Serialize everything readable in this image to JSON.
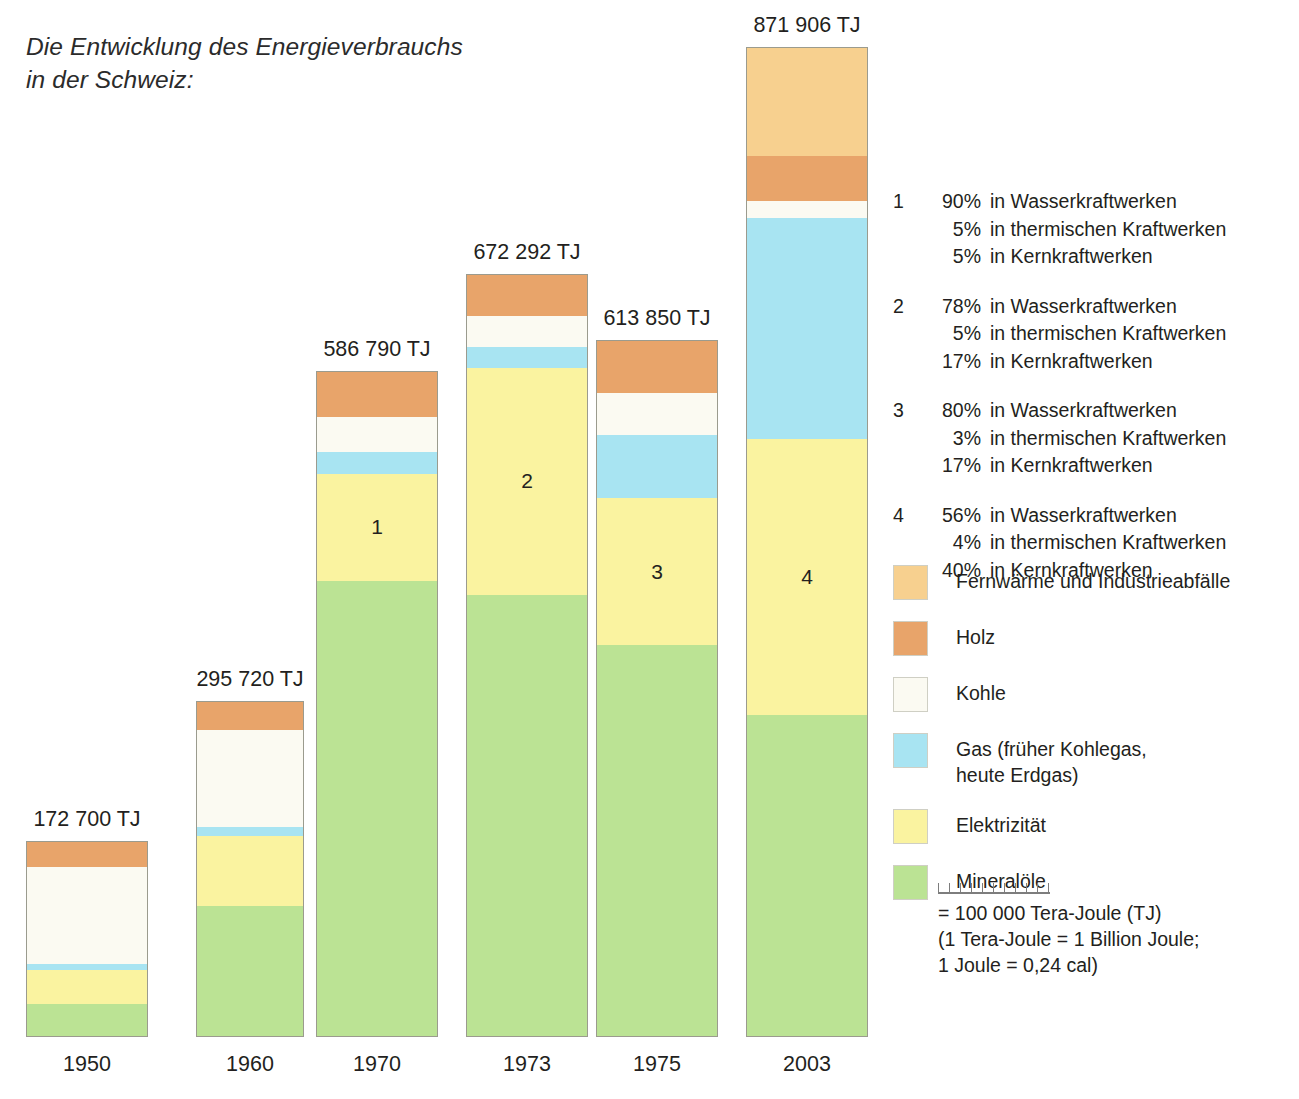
{
  "title": {
    "line1": "Die Entwicklung des Energieverbrauchs",
    "line2": "in der Schweiz:"
  },
  "chart_data": {
    "type": "bar",
    "subtype": "stacked-bar",
    "title": "Die Entwicklung des Energieverbrauchs in der Schweiz:",
    "xlabel": "",
    "ylabel": "Tera-Joule (TJ)",
    "unit": "TJ",
    "grid": false,
    "legend_position": "right",
    "scale_note": "= 100 000 Tera-Joule (TJ)",
    "categories": [
      "1950",
      "1960",
      "1970",
      "1973",
      "1975",
      "2003"
    ],
    "totals": [
      172700,
      295720,
      586790,
      672292,
      613850,
      871906
    ],
    "total_labels": [
      "172 700 TJ",
      "295 720 TJ",
      "586 790 TJ",
      "672 292 TJ",
      "613 850 TJ",
      "871 906 TJ"
    ],
    "series": [
      {
        "name": "Mineralöle",
        "key": "mineraloele",
        "color": "#BBE394",
        "values": [
          25000,
          115000,
          360000,
          390000,
          345000,
          345000
        ]
      },
      {
        "name": "Elektrizität",
        "key": "elektrizitaet",
        "color": "#FAF3A0",
        "values": [
          30000,
          62000,
          95000,
          200000,
          130000,
          243000
        ]
      },
      {
        "name": "Gas (früher Kohlegas, heute Erdgas)",
        "key": "gas",
        "color": "#A8E4F2",
        "values": [
          6000,
          8000,
          19000,
          19000,
          56000,
          195000
        ]
      },
      {
        "name": "Kohle",
        "key": "kohle",
        "color": "#FBFAF2",
        "values": [
          90000,
          86000,
          73000,
          27000,
          37000,
          15000
        ]
      },
      {
        "name": "Holz",
        "key": "holz",
        "color": "#E8A46A",
        "values": [
          22000,
          25000,
          40000,
          36000,
          46000,
          40000
        ]
      },
      {
        "name": "Fernwärme und Industrieabfälle",
        "key": "fernwaerme",
        "color": "#F7D08F",
        "values": [
          0,
          0,
          0,
          0,
          0,
          95000
        ]
      }
    ],
    "segment_annotations": [
      {
        "category": "1970",
        "series": "Elektrizität",
        "label": "1"
      },
      {
        "category": "1973",
        "series": "Elektrizität",
        "label": "2"
      },
      {
        "category": "1975",
        "series": "Elektrizität",
        "label": "3"
      },
      {
        "category": "2003",
        "series": "Elektrizität",
        "label": "4"
      }
    ]
  },
  "bars": [
    {
      "year": "1950",
      "total_label": "172 700 TJ",
      "segments": [
        {
          "key": "fernwaerme",
          "pct": 0,
          "num": ""
        },
        {
          "key": "holz",
          "pct": 12.7,
          "num": ""
        },
        {
          "key": "kohle",
          "pct": 50.0,
          "num": ""
        },
        {
          "key": "gas",
          "pct": 3.5,
          "num": ""
        },
        {
          "key": "elektrizitaet",
          "pct": 17.4,
          "num": ""
        },
        {
          "key": "mineraloele",
          "pct": 16.4,
          "num": ""
        }
      ]
    },
    {
      "year": "1960",
      "total_label": "295 720 TJ",
      "segments": [
        {
          "key": "fernwaerme",
          "pct": 0,
          "num": ""
        },
        {
          "key": "holz",
          "pct": 8.4,
          "num": ""
        },
        {
          "key": "kohle",
          "pct": 29.1,
          "num": ""
        },
        {
          "key": "gas",
          "pct": 2.7,
          "num": ""
        },
        {
          "key": "elektrizitaet",
          "pct": 20.9,
          "num": ""
        },
        {
          "key": "mineraloele",
          "pct": 38.9,
          "num": ""
        }
      ]
    },
    {
      "year": "1970",
      "total_label": "586 790 TJ",
      "segments": [
        {
          "key": "fernwaerme",
          "pct": 0,
          "num": ""
        },
        {
          "key": "holz",
          "pct": 6.8,
          "num": ""
        },
        {
          "key": "kohle",
          "pct": 5.3,
          "num": ""
        },
        {
          "key": "gas",
          "pct": 3.2,
          "num": ""
        },
        {
          "key": "elektrizitaet",
          "pct": 16.2,
          "num": "1"
        },
        {
          "key": "mineraloele",
          "pct": 68.5,
          "num": ""
        }
      ]
    },
    {
      "year": "1973",
      "total_label": "672 292 TJ",
      "segments": [
        {
          "key": "fernwaerme",
          "pct": 0,
          "num": ""
        },
        {
          "key": "holz",
          "pct": 5.4,
          "num": ""
        },
        {
          "key": "kohle",
          "pct": 4.0,
          "num": ""
        },
        {
          "key": "gas",
          "pct": 2.8,
          "num": ""
        },
        {
          "key": "elektrizitaet",
          "pct": 29.8,
          "num": "2"
        },
        {
          "key": "mineraloele",
          "pct": 58.0,
          "num": ""
        }
      ]
    },
    {
      "year": "1975",
      "total_label": "613 850 TJ",
      "segments": [
        {
          "key": "fernwaerme",
          "pct": 0,
          "num": ""
        },
        {
          "key": "holz",
          "pct": 7.5,
          "num": ""
        },
        {
          "key": "kohle",
          "pct": 6.0,
          "num": ""
        },
        {
          "key": "gas",
          "pct": 9.1,
          "num": ""
        },
        {
          "key": "elektrizitaet",
          "pct": 21.2,
          "num": "3"
        },
        {
          "key": "mineraloele",
          "pct": 56.2,
          "num": ""
        }
      ]
    },
    {
      "year": "2003",
      "total_label": "871 906 TJ",
      "segments": [
        {
          "key": "fernwaerme",
          "pct": 10.9,
          "num": ""
        },
        {
          "key": "holz",
          "pct": 4.6,
          "num": ""
        },
        {
          "key": "kohle",
          "pct": 1.7,
          "num": ""
        },
        {
          "key": "gas",
          "pct": 22.4,
          "num": ""
        },
        {
          "key": "elektrizitaet",
          "pct": 27.9,
          "num": "4"
        },
        {
          "key": "mineraloele",
          "pct": 32.5,
          "num": ""
        }
      ]
    }
  ],
  "notes": [
    {
      "index": "1",
      "lines": [
        {
          "pct": "90%",
          "text": "in Wasserkraftwerken"
        },
        {
          "pct": "5%",
          "text": "in thermischen Kraftwerken"
        },
        {
          "pct": "5%",
          "text": "in Kernkraftwerken"
        }
      ]
    },
    {
      "index": "2",
      "lines": [
        {
          "pct": "78%",
          "text": "in Wasserkraftwerken"
        },
        {
          "pct": "5%",
          "text": "in thermischen Kraftwerken"
        },
        {
          "pct": "17%",
          "text": "in Kernkraftwerken"
        }
      ]
    },
    {
      "index": "3",
      "lines": [
        {
          "pct": "80%",
          "text": "in Wasserkraftwerken"
        },
        {
          "pct": "3%",
          "text": "in thermischen Kraftwerken"
        },
        {
          "pct": "17%",
          "text": "in Kernkraftwerken"
        }
      ]
    },
    {
      "index": "4",
      "lines": [
        {
          "pct": "56%",
          "text": "in Wasserkraftwerken"
        },
        {
          "pct": "4%",
          "text": "in thermischen Kraftwerken"
        },
        {
          "pct": "40%",
          "text": "in Kernkraftwerken"
        }
      ]
    }
  ],
  "legend": [
    {
      "key": "fernwaerme",
      "color": "#F7D08F",
      "line1": "Fernwärme und Industrieabfälle",
      "line2": ""
    },
    {
      "key": "holz",
      "color": "#E8A46A",
      "line1": "Holz",
      "line2": ""
    },
    {
      "key": "kohle",
      "color": "#FBFAF2",
      "line1": "Kohle",
      "line2": ""
    },
    {
      "key": "gas",
      "color": "#A8E4F2",
      "line1": "Gas (früher Kohlegas,",
      "line2": "heute Erdgas)"
    },
    {
      "key": "elektrizitaet",
      "color": "#FAF3A0",
      "line1": "Elektrizität",
      "line2": ""
    },
    {
      "key": "mineraloele",
      "color": "#BBE394",
      "line1": "Mineralöle",
      "line2": ""
    }
  ],
  "scale": {
    "ticks": 11,
    "line1": "= 100 000 Tera-Joule (TJ)",
    "line2": "(1 Tera-Joule = 1 Billion Joule;",
    "line3": "1 Joule = 0,24 cal)"
  },
  "colors": {
    "fernwaerme": "#F7D08F",
    "holz": "#E8A46A",
    "kohle": "#FBFAF2",
    "gas": "#A8E4F2",
    "elektrizitaet": "#FAF3A0",
    "mineraloele": "#BBE394",
    "bar_border": "#9b9b8e",
    "text": "#231f20"
  }
}
